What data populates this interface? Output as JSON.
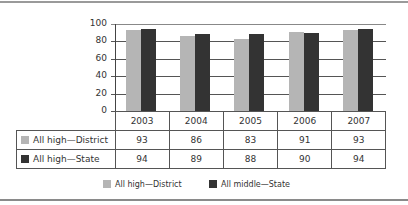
{
  "chart_data": {
    "type": "bar",
    "title": "",
    "xlabel": "",
    "ylabel": "",
    "ylim": [
      0,
      100
    ],
    "yticks": [
      0,
      20,
      40,
      60,
      80,
      100
    ],
    "grid": true,
    "categories": [
      "2003",
      "2004",
      "2005",
      "2006",
      "2007"
    ],
    "series": [
      {
        "name": "All high—District",
        "color": "#b5b5b5",
        "values": [
          93,
          86,
          83,
          91,
          93
        ]
      },
      {
        "name": "All high—State",
        "color": "#333333",
        "values": [
          94,
          89,
          88,
          90,
          94
        ]
      }
    ],
    "legend": [
      "All high—District",
      "All middle—State"
    ],
    "legend_position": "bottom"
  },
  "table": {
    "rows": [
      {
        "label": "All high—District",
        "values": [
          "93",
          "86",
          "83",
          "91",
          "93"
        ]
      },
      {
        "label": "All high—State",
        "values": [
          "94",
          "89",
          "88",
          "90",
          "94"
        ]
      }
    ]
  },
  "legend": {
    "item0": "All high—District",
    "item1": "All middle—State"
  }
}
